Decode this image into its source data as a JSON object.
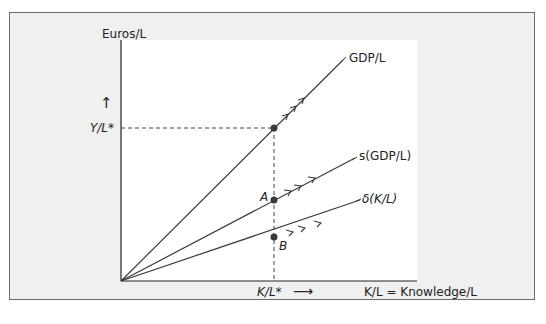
{
  "figure": {
    "y_axis_label": "Euros/L",
    "x_axis_label": "K/L = Knowledge/L",
    "y_marker_label": "Y/L*",
    "x_marker_label": "K/L*",
    "x_marker_arrow": "⟶",
    "y_marker_arrow": "↑",
    "curves": [
      {
        "name": "GDP/L",
        "label": "GDP/L"
      },
      {
        "name": "s(GDP/L)",
        "label": "s(GDP/L)"
      },
      {
        "name": "delta(K/L)",
        "label": "δ(K/L)"
      }
    ],
    "points": [
      {
        "label": "A",
        "description": "intersection of s(GDP/L) with K/L*"
      },
      {
        "label": "B",
        "description": "intersection of δ(K/L) with K/L*"
      }
    ]
  },
  "colors": {
    "panel_bg": "#f0f0f0",
    "panel_border": "#6a6a6a",
    "line": "#3a3a3a",
    "point": "#3a3a3a"
  }
}
